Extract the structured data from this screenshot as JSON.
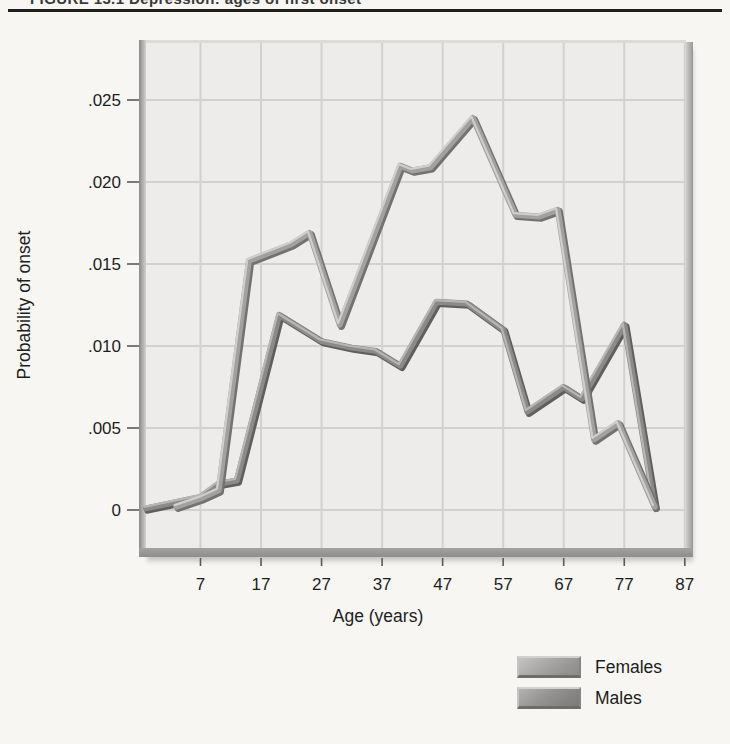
{
  "header": {
    "title": "FIGURE 13.1  Depression: ages of first onset"
  },
  "chart_data": {
    "type": "line",
    "title": "Depression: ages of first onset",
    "xlabel": "Age (years)",
    "ylabel": "Probability of onset",
    "x_domain": [
      -2,
      87.2
    ],
    "y_domain": [
      -0.0023,
      0.0285
    ],
    "grid": true,
    "gridline_color": "#d2d1cf",
    "panel_color": "#edecea",
    "legend_position": "bottom-right",
    "x_ticks": [
      {
        "v": 7,
        "label": "7"
      },
      {
        "v": 17,
        "label": "17"
      },
      {
        "v": 27,
        "label": "27"
      },
      {
        "v": 37,
        "label": "37"
      },
      {
        "v": 47,
        "label": "47"
      },
      {
        "v": 57,
        "label": "57"
      },
      {
        "v": 67,
        "label": "67"
      },
      {
        "v": 77,
        "label": "77"
      },
      {
        "v": 87,
        "label": "87"
      }
    ],
    "y_ticks": [
      {
        "v": 0,
        "label": "0"
      },
      {
        "v": 0.005,
        "label": ".005"
      },
      {
        "v": 0.01,
        "label": ".010"
      },
      {
        "v": 0.015,
        "label": ".015"
      },
      {
        "v": 0.02,
        "label": ".020"
      },
      {
        "v": 0.025,
        "label": ".025"
      }
    ],
    "series": [
      {
        "name": "Males",
        "color": "#8b8a88",
        "color_dark": "#615f5d",
        "color_light": "#b7b6b3",
        "points": [
          [
            -2,
            0.0001
          ],
          [
            7,
            0.0008
          ],
          [
            10,
            0.0016
          ],
          [
            13,
            0.0018
          ],
          [
            20,
            0.0119
          ],
          [
            27,
            0.0103
          ],
          [
            32,
            0.0099
          ],
          [
            36,
            0.0097
          ],
          [
            40,
            0.0088
          ],
          [
            46,
            0.0127
          ],
          [
            51,
            0.0126
          ],
          [
            57,
            0.011
          ],
          [
            61,
            0.006
          ],
          [
            67,
            0.0075
          ],
          [
            70,
            0.0068
          ],
          [
            77,
            0.0113
          ],
          [
            82,
            0.0002
          ]
        ]
      },
      {
        "name": "Females",
        "color": "#a2a19f",
        "color_dark": "#737270",
        "color_light": "#cfcecb",
        "points": [
          [
            3,
            0.0002
          ],
          [
            7,
            0.0007
          ],
          [
            10,
            0.0012
          ],
          [
            15,
            0.0152
          ],
          [
            22,
            0.0162
          ],
          [
            25,
            0.0169
          ],
          [
            30,
            0.0113
          ],
          [
            40,
            0.021
          ],
          [
            42,
            0.0207
          ],
          [
            45,
            0.0209
          ],
          [
            52,
            0.0239
          ],
          [
            59,
            0.018
          ],
          [
            63,
            0.0179
          ],
          [
            66,
            0.0183
          ],
          [
            72,
            0.0043
          ],
          [
            76,
            0.0053
          ],
          [
            82,
            0.0002
          ]
        ]
      }
    ]
  },
  "legend": {
    "items": [
      {
        "label": "Females"
      },
      {
        "label": "Males"
      }
    ]
  }
}
